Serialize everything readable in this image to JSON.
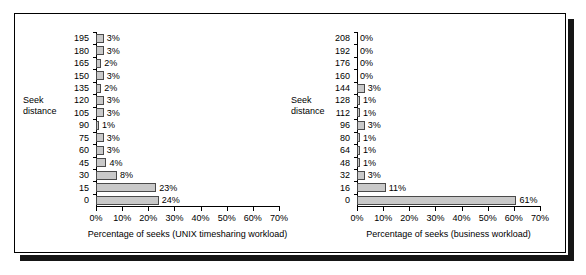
{
  "figure": {
    "border_color": "#000000",
    "shadow_color": "#161616",
    "bar_fill": "#c9c9c9",
    "bar_stroke": "#4a4a4a"
  },
  "chart_data": [
    {
      "type": "bar",
      "orientation": "horizontal",
      "panel": "left",
      "title": "",
      "xlabel": "Percentage of seeks (UNIX timesharing workload)",
      "ylabel": "Seek distance",
      "ylabel_line1": "Seek",
      "ylabel_line2": "distance",
      "xlim": [
        0,
        70
      ],
      "xticks": [
        0,
        10,
        20,
        30,
        40,
        50,
        60,
        70
      ],
      "xtick_labels": [
        "0%",
        "10%",
        "20%",
        "30%",
        "40%",
        "50%",
        "60%",
        "70%"
      ],
      "grid": false,
      "legend": "none",
      "categories": [
        "195",
        "180",
        "165",
        "150",
        "135",
        "120",
        "105",
        "90",
        "75",
        "60",
        "45",
        "30",
        "15",
        "0"
      ],
      "values": [
        3,
        3,
        2,
        3,
        2,
        3,
        3,
        1,
        3,
        3,
        4,
        8,
        23,
        24
      ],
      "value_labels": [
        "3%",
        "3%",
        "2%",
        "3%",
        "2%",
        "3%",
        "3%",
        "1%",
        "3%",
        "3%",
        "4%",
        "8%",
        "23%",
        "24%"
      ]
    },
    {
      "type": "bar",
      "orientation": "horizontal",
      "panel": "right",
      "title": "",
      "xlabel": "Percentage of seeks (business workload)",
      "ylabel": "Seek distance",
      "ylabel_line1": "Seek",
      "ylabel_line2": "distance",
      "xlim": [
        0,
        70
      ],
      "xticks": [
        0,
        10,
        20,
        30,
        40,
        50,
        60,
        70
      ],
      "xtick_labels": [
        "0%",
        "10%",
        "20%",
        "30%",
        "40%",
        "50%",
        "60%",
        "70%"
      ],
      "grid": false,
      "legend": "none",
      "categories": [
        "208",
        "192",
        "176",
        "160",
        "144",
        "128",
        "112",
        "96",
        "80",
        "64",
        "48",
        "32",
        "16",
        "0"
      ],
      "values": [
        0,
        0,
        0,
        0,
        3,
        1,
        1,
        3,
        1,
        1,
        1,
        3,
        11,
        61
      ],
      "value_labels": [
        "0%",
        "0%",
        "0%",
        "0%",
        "3%",
        "1%",
        "1%",
        "3%",
        "1%",
        "1%",
        "1%",
        "3%",
        "11%",
        "61%"
      ]
    }
  ]
}
